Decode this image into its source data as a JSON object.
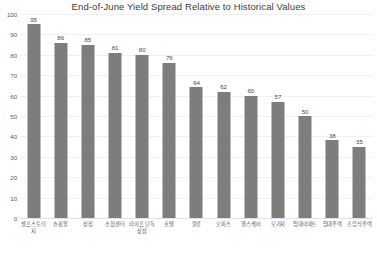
{
  "chart_data": {
    "type": "bar",
    "title": "End-of-June Yield Spread Relative to Historical Values",
    "xlabel": "",
    "ylabel": "",
    "ylim": [
      0,
      100
    ],
    "ytick_step": 10,
    "ytick_labels": [
      "100",
      "90",
      "80",
      "70",
      "60",
      "50",
      "40",
      "30",
      "20",
      "10",
      "0"
    ],
    "grid": true,
    "legend": "none",
    "bar_color": "#7d7d7d",
    "background_color": "#ffffff",
    "categories": [
      "셀프스토리지",
      "쇼핑몰",
      "상점",
      "소형센터",
      "라이프 단독\n상점",
      "호텔",
      "물류",
      "오피스",
      "헬스케어",
      "모기지",
      "임대아파트",
      "임대주택",
      "조립식주택"
    ],
    "values": [
      95,
      86,
      85,
      81,
      80,
      76,
      64,
      62,
      60,
      57,
      50,
      38,
      35
    ],
    "data_labels": [
      "95",
      "86",
      "85",
      "81",
      "80",
      "76",
      "64",
      "62",
      "60",
      "57",
      "50",
      "38",
      "35"
    ]
  }
}
